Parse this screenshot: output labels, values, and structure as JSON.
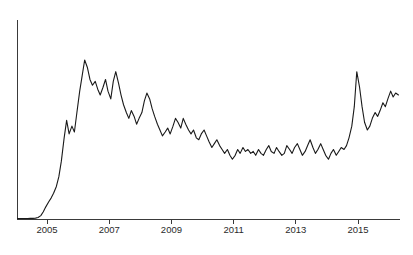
{
  "chart_data": {
    "type": "line",
    "title": "",
    "subtitle": "",
    "xlabel": "",
    "ylabel": "",
    "grid": false,
    "legend": null,
    "legend_position": "none",
    "axis_color": "#3a3a3a",
    "series_color": "#1a1a1a",
    "background_color": "#ffffff",
    "xlim": [
      2004.05,
      2016.35
    ],
    "ylim": [
      0,
      100
    ],
    "y_axis_visible": true,
    "y_ticks": [],
    "y_ticklabels": [],
    "x_ticks": [
      2005,
      2007,
      2009,
      2011,
      2013,
      2015
    ],
    "x_ticklabels": [
      "2005",
      "2007",
      "2009",
      "2011",
      "2013",
      "2015"
    ],
    "series": [
      {
        "name": "series-1",
        "x": [
          2004.05,
          2004.13,
          2004.21,
          2004.3,
          2004.38,
          2004.46,
          2004.55,
          2004.63,
          2004.71,
          2004.8,
          2004.88,
          2004.96,
          2005.05,
          2005.13,
          2005.21,
          2005.3,
          2005.38,
          2005.46,
          2005.55,
          2005.63,
          2005.71,
          2005.8,
          2005.88,
          2005.96,
          2006.05,
          2006.13,
          2006.21,
          2006.3,
          2006.38,
          2006.46,
          2006.55,
          2006.63,
          2006.71,
          2006.8,
          2006.88,
          2006.96,
          2007.05,
          2007.13,
          2007.21,
          2007.3,
          2007.38,
          2007.46,
          2007.55,
          2007.63,
          2007.71,
          2007.8,
          2007.88,
          2007.96,
          2008.05,
          2008.13,
          2008.21,
          2008.3,
          2008.38,
          2008.46,
          2008.55,
          2008.63,
          2008.71,
          2008.8,
          2008.88,
          2008.96,
          2009.05,
          2009.13,
          2009.21,
          2009.3,
          2009.38,
          2009.46,
          2009.55,
          2009.63,
          2009.71,
          2009.8,
          2009.88,
          2009.96,
          2010.05,
          2010.13,
          2010.21,
          2010.3,
          2010.38,
          2010.46,
          2010.55,
          2010.63,
          2010.71,
          2010.8,
          2010.88,
          2010.96,
          2011.05,
          2011.13,
          2011.21,
          2011.3,
          2011.38,
          2011.46,
          2011.55,
          2011.63,
          2011.71,
          2011.8,
          2011.88,
          2011.96,
          2012.05,
          2012.13,
          2012.21,
          2012.3,
          2012.38,
          2012.46,
          2012.55,
          2012.63,
          2012.71,
          2012.8,
          2012.88,
          2012.96,
          2013.05,
          2013.13,
          2013.21,
          2013.3,
          2013.38,
          2013.46,
          2013.55,
          2013.63,
          2013.71,
          2013.8,
          2013.88,
          2013.96,
          2014.05,
          2014.13,
          2014.21,
          2014.3,
          2014.38,
          2014.46,
          2014.55,
          2014.63,
          2014.71,
          2014.8,
          2014.88,
          2014.96,
          2015.05,
          2015.13,
          2015.21,
          2015.3,
          2015.38,
          2015.46,
          2015.55,
          2015.63,
          2015.71,
          2015.8,
          2015.88,
          2015.96,
          2016.05,
          2016.13,
          2016.21,
          2016.3
        ],
        "y": [
          0.5,
          0.5,
          0.5,
          0.5,
          0.5,
          0.6,
          0.6,
          0.7,
          1.0,
          2.0,
          4.0,
          6.5,
          9.0,
          11.0,
          13.5,
          17.0,
          22.0,
          30.0,
          42.0,
          51.0,
          44.0,
          48.0,
          45.0,
          55.0,
          66.0,
          74.0,
          82.0,
          78.0,
          72.0,
          69.0,
          71.0,
          67.0,
          64.0,
          68.0,
          72.0,
          66.0,
          62.0,
          71.0,
          76.0,
          70.0,
          64.0,
          59.0,
          55.0,
          52.0,
          56.0,
          53.0,
          49.0,
          52.0,
          55.0,
          61.0,
          65.0,
          62.0,
          57.0,
          53.0,
          49.0,
          46.0,
          43.0,
          45.0,
          47.0,
          44.0,
          48.0,
          52.0,
          50.0,
          47.0,
          52.0,
          49.0,
          46.0,
          44.0,
          46.0,
          42.0,
          41.0,
          44.0,
          46.0,
          43.0,
          40.0,
          37.0,
          39.0,
          41.0,
          38.0,
          36.0,
          34.0,
          36.0,
          33.0,
          31.0,
          33.0,
          36.0,
          34.0,
          37.0,
          35.0,
          36.0,
          34.0,
          35.0,
          33.0,
          36.0,
          34.0,
          33.0,
          36.0,
          38.0,
          35.0,
          34.0,
          37.0,
          35.0,
          33.0,
          34.0,
          38.0,
          36.0,
          34.0,
          37.0,
          39.0,
          36.0,
          33.0,
          35.0,
          38.0,
          41.0,
          37.0,
          34.0,
          36.0,
          39.0,
          36.0,
          33.0,
          31.0,
          34.0,
          36.0,
          33.0,
          35.0,
          37.0,
          36.0,
          38.0,
          42.0,
          48.0,
          58.0,
          76.0,
          68.0,
          58.0,
          50.0,
          46.0,
          48.0,
          52.0,
          55.0,
          53.0,
          56.0,
          60.0,
          58.0,
          62.0,
          66.0,
          63.0,
          65.0,
          64.0
        ]
      }
    ],
    "annotations": []
  }
}
